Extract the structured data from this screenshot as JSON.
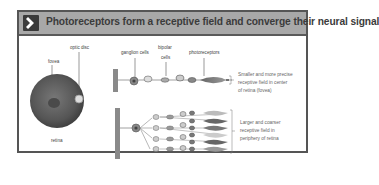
{
  "header": {
    "icon": "chevron-right-icon",
    "title": "Photoreceptors form a receptive field and converge their neural signal"
  },
  "retina_panel": {
    "labels": {
      "optic_disc": "optic disc",
      "fovea": "fovea",
      "retina": "retina"
    }
  },
  "pathway_labels": {
    "ganglion_cells": "ganglion cells",
    "bipolar_line1": "bipolar",
    "bipolar_line2": "cells",
    "photoreceptors": "photoreceptors"
  },
  "descriptions": {
    "top": [
      "Smaller and more precise",
      "receptive field in center",
      "of retina (fovea)"
    ],
    "bottom": [
      "Larger and coarser",
      "receptive field in",
      "periphery of retina"
    ]
  },
  "colors": {
    "header_bg": "#a8a8a8",
    "frame_border": "#555555",
    "icon_bg": "#3a3a3a"
  }
}
